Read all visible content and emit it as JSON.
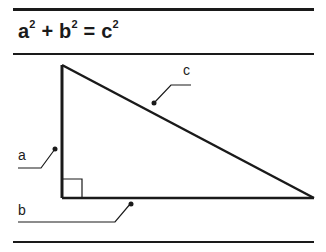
{
  "title": {
    "formula": {
      "a": "a",
      "b": "b",
      "c": "c",
      "exp": "2",
      "plus": "+",
      "equals": "="
    }
  },
  "diagram": {
    "type": "right-triangle",
    "labels": {
      "leg_vertical": "a",
      "leg_horizontal": "b",
      "hypotenuse": "c"
    },
    "colors": {
      "stroke": "#1a1a1a",
      "background": "#ffffff"
    }
  }
}
